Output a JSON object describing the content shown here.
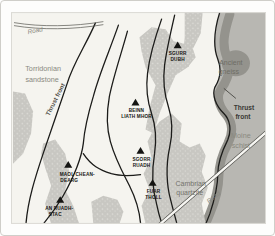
{
  "colors": {
    "map_background": "#f5f4ef",
    "cambrian_quartzite_fill": "#c8c7c2",
    "quartzite_speckle": "#e0dfda",
    "moine_schist_fill": "#b8b7b2",
    "ancient_gneiss_fill": "#94938d",
    "fault_line": "#1c1c1a",
    "region_label_gray": "#8a8980",
    "peak_label_black": "#141412"
  },
  "regions": {
    "torridonian": {
      "name": "Torridonian sandstone",
      "line1": "Torridonian",
      "line2": "sandstone"
    },
    "moine": {
      "name": "Moine schist",
      "line1": "Moine",
      "line2": "schist"
    },
    "cambrian": {
      "name": "Cambrian quartzite",
      "line1": "Cambrian",
      "line2": "quartzite"
    },
    "gneiss": {
      "name": "Ancient gneiss",
      "line1": "Ancient",
      "line2": "gneiss"
    }
  },
  "peaks": [
    {
      "name": "Sgurr Dubh",
      "line1": "SGURR",
      "line2": "DUBH"
    },
    {
      "name": "Beinn Liath Mhor",
      "line1": "BEINN",
      "line2": "LIATH MHOR"
    },
    {
      "name": "Sgorr Ruadh",
      "line1": "SGORR",
      "line2": "RUADH"
    },
    {
      "name": "Fuar Tholl",
      "line1": "FUAR",
      "line2": "THOLL"
    },
    {
      "name": "Maol Chean-Dearg",
      "line1": "MAOL CHEAN-",
      "line2": "DEARG"
    },
    {
      "name": "An Ruadh-Stac",
      "line1": "AN RUADH-",
      "line2": "STAC"
    }
  ],
  "annotations": {
    "thrust_front_left": "Thrust front",
    "thrust_right_line1": "Thrust",
    "thrust_right_line2": "front",
    "road_top": "Road",
    "road_bottom": "Road"
  }
}
